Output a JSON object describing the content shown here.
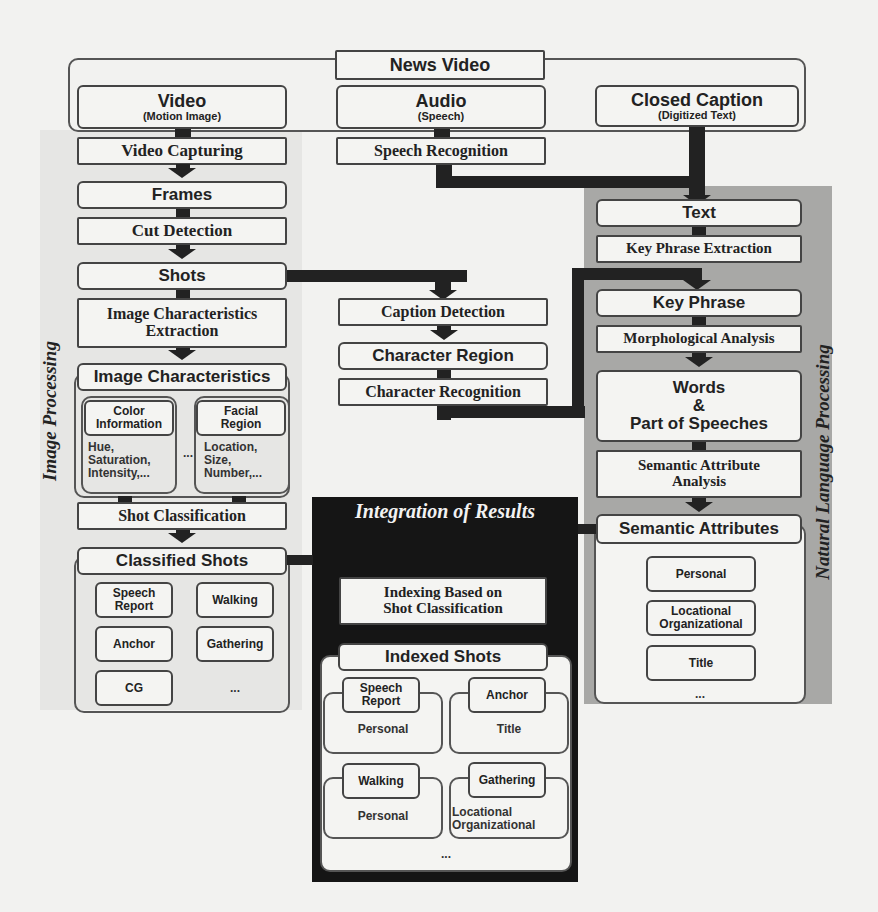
{
  "diagram": {
    "source": {
      "news_video": "News Video",
      "video_title": "Video",
      "video_sub": "(Motion Image)",
      "audio_title": "Audio",
      "audio_sub": "(Speech)",
      "cc_title": "Closed Caption",
      "cc_sub": "(Digitized Text)"
    },
    "image_processing": {
      "label": "Image Processing",
      "video_capturing": "Video Capturing",
      "frames": "Frames",
      "cut_detection": "Cut Detection",
      "shots": "Shots",
      "ice_line1": "Image Characteristics",
      "ice_line2": "Extraction",
      "image_characteristics": "Image Characteristics",
      "color_info_line1": "Color",
      "color_info_line2": "Information",
      "color_details": [
        "Hue,",
        "Saturation,",
        "Intensity,..."
      ],
      "ellipsis": "...",
      "facial_line1": "Facial",
      "facial_line2": "Region",
      "facial_details": [
        "Location,",
        "Size,",
        "Number,..."
      ],
      "shot_classification": "Shot Classification",
      "classified_shots": "Classified Shots",
      "classes": {
        "speech_report_1": "Speech",
        "speech_report_2": "Report",
        "walking": "Walking",
        "anchor": "Anchor",
        "gathering": "Gathering",
        "cg": "CG",
        "more": "..."
      }
    },
    "caption_pipeline": {
      "speech_recognition": "Speech Recognition",
      "caption_detection": "Caption Detection",
      "character_region": "Character Region",
      "character_recognition": "Character Recognition"
    },
    "nlp": {
      "label": "Natural Language Processing",
      "text": "Text",
      "key_phrase_extraction": "Key Phrase Extraction",
      "key_phrase": "Key Phrase",
      "morphological_analysis": "Morphological Analysis",
      "words_line1": "Words",
      "words_line2": "&",
      "words_line3": "Part of Speeches",
      "saa_line1": "Semantic Attribute",
      "saa_line2": "Analysis",
      "semantic_attributes": "Semantic Attributes",
      "attrs": {
        "personal": "Personal",
        "loc_org_1": "Locational",
        "loc_org_2": "Organizational",
        "title": "Title",
        "more": "..."
      }
    },
    "integration": {
      "label": "Integration of Results",
      "indexing_line1": "Indexing Based on",
      "indexing_line2": "Shot Classification",
      "indexed_shots": "Indexed Shots",
      "cells": [
        {
          "tag1": "Speech",
          "tag2": "Report",
          "value1": "Personal",
          "value2": ""
        },
        {
          "tag1": "Anchor",
          "tag2": "",
          "value1": "Title",
          "value2": ""
        },
        {
          "tag1": "Walking",
          "tag2": "",
          "value1": "Personal",
          "value2": ""
        },
        {
          "tag1": "Gathering",
          "tag2": "",
          "value1": "Locational",
          "value2": "Organizational"
        }
      ],
      "more": "..."
    },
    "colors": {
      "background": "#f2f2f0",
      "box_fill": "#f4f4f2",
      "outline": "#444444",
      "connector": "#222222",
      "nlp_panel": "#a9a9a9",
      "image_panel": "#e3e3e1",
      "integration_panel": "#151515"
    }
  }
}
